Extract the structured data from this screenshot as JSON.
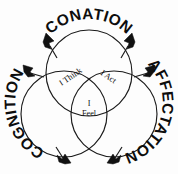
{
  "figure": {
    "background_color": "#fdfdfd",
    "stroke_color": "#1a1a1a"
  },
  "outer_labels": {
    "top": "CONATION",
    "right": "AFFECTATION",
    "left": "COGNITION"
  },
  "inner_labels": {
    "left_lens": "I Think",
    "right_lens": "I Act",
    "bottom_lens_line1": "I",
    "bottom_lens_line2": "Feel"
  },
  "icons": {
    "arrow_top_left": "arrowhead-icon",
    "arrow_top_right": "arrowhead-icon",
    "arrow_right_top": "arrowhead-icon",
    "arrow_right_bottom": "arrowhead-icon",
    "arrow_left_top": "arrowhead-icon",
    "arrow_left_bottom": "arrowhead-icon"
  }
}
